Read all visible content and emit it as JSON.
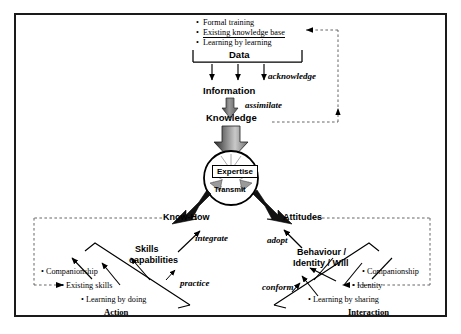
{
  "diagram": {
    "frame": {
      "border_color": "#1a1a1a"
    },
    "top_block": {
      "items": [
        "Formal training",
        "Existing knowledge base",
        "Learning by learning"
      ],
      "group_label": "Data"
    },
    "flow": {
      "acknowledge": "acknowledge",
      "information": "Information",
      "assimilate": "assimilate",
      "knowledge": "Knowledge"
    },
    "core": {
      "expertise": "Expertise",
      "transmit": "Transmit"
    },
    "left_branch": {
      "know_how": "Know-How",
      "integrate": "integrate",
      "skills_line1": "Skills",
      "skills_line2": "capabilities",
      "practice": "practice",
      "items": [
        "Companionship",
        "Existing skills",
        "Learning by doing"
      ],
      "group_label": "Action"
    },
    "right_branch": {
      "attitudes": "Attitudes",
      "adopt": "adopt",
      "behaviour_line1": "Behaviour /",
      "behaviour_line2": "Identity / Will",
      "conform": "conform",
      "items": [
        "Companionship",
        "Identity",
        "Learning by sharing"
      ],
      "group_label": "Interaction"
    },
    "colors": {
      "line": "#000000",
      "dashed": "#555555",
      "arrow_fill": "#1a1a1a"
    }
  }
}
